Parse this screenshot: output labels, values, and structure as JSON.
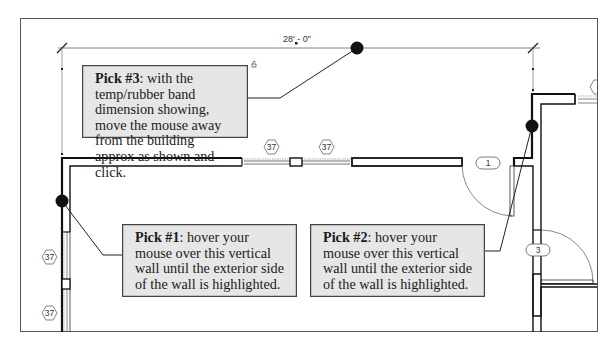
{
  "dimension": {
    "label": "28' - 0\"",
    "feet": "28'",
    "inches": "0\""
  },
  "callouts": [
    {
      "id": "pick3",
      "title": "Pick #3",
      "text": ": with the temp/rubber band dimension showing, move the mouse away from the building approx as shown and click."
    },
    {
      "id": "pick1",
      "title": "Pick #1",
      "text": ": hover your mouse over this vertical wall until the exterior side of the wall is highlighted."
    },
    {
      "id": "pick2",
      "title": "Pick #2",
      "text": ": hover your mouse over this vertical wall until the exterior side of the wall is highlighted."
    }
  ],
  "window_tags": [
    "37",
    "37",
    "37",
    "37"
  ],
  "door_tags": [
    "1",
    "3"
  ],
  "colors": {
    "callout_fill": "#e6e6e6",
    "callout_border": "#444444",
    "pick_dot": "#111111",
    "wall": "#111111"
  }
}
